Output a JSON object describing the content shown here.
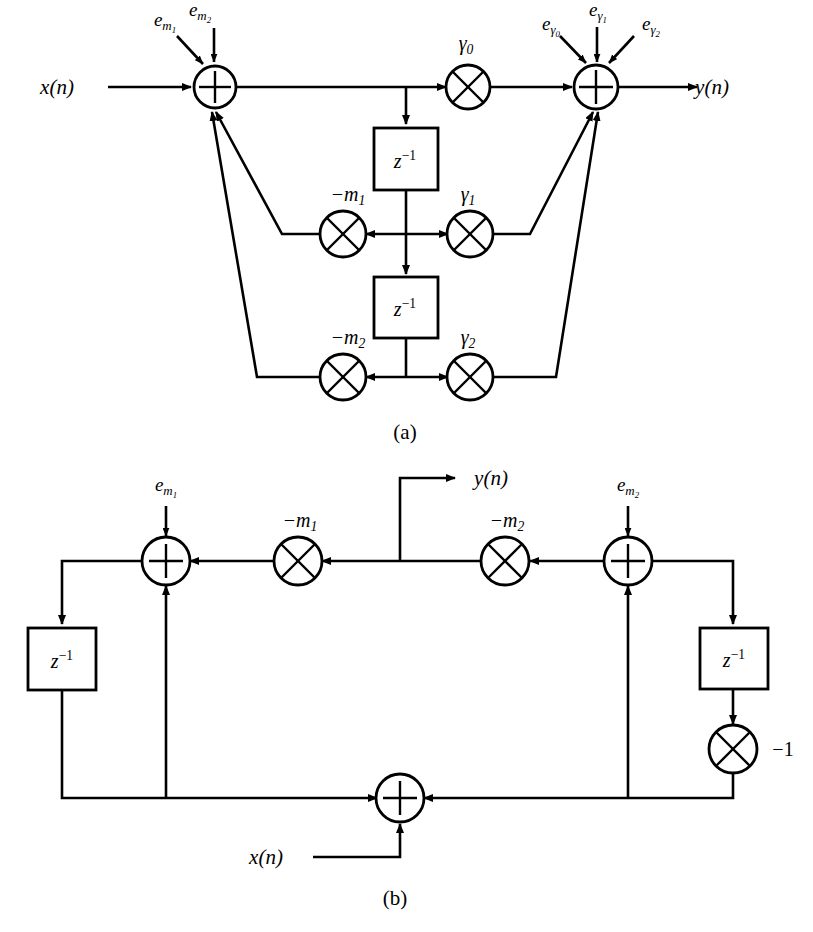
{
  "figure": {
    "background_color": "#ffffff",
    "line_color": "#000000",
    "panels": [
      {
        "id": "a",
        "caption": "(a)"
      },
      {
        "id": "b",
        "caption": "(b)"
      }
    ]
  },
  "panel_a": {
    "caption": "(a)",
    "input_label": "x(n)",
    "output_label": "y(n)",
    "adders": [
      {
        "name": "input-adder",
        "symbol": "+"
      },
      {
        "name": "output-adder",
        "symbol": "+"
      }
    ],
    "error_inputs_left": [
      {
        "base": "e",
        "subscript": "m",
        "subsubscript": "1",
        "text": "e_m1"
      },
      {
        "base": "e",
        "subscript": "m",
        "subsubscript": "2",
        "text": "e_m2"
      }
    ],
    "error_inputs_right": [
      {
        "base": "e",
        "subscript": "γ",
        "subsubscript": "0",
        "text": "e_gamma0"
      },
      {
        "base": "e",
        "subscript": "γ",
        "subsubscript": "1",
        "text": "e_gamma1"
      },
      {
        "base": "e",
        "subscript": "γ",
        "subsubscript": "2",
        "text": "e_gamma2"
      }
    ],
    "multipliers": [
      {
        "name": "gamma0",
        "base": "γ",
        "sub": "0"
      },
      {
        "name": "gamma1",
        "base": "γ",
        "sub": "1"
      },
      {
        "name": "gamma2",
        "base": "γ",
        "sub": "2"
      },
      {
        "name": "minus-m1",
        "base": "−m",
        "sub": "1"
      },
      {
        "name": "minus-m2",
        "base": "−m",
        "sub": "2"
      }
    ],
    "delay_blocks": [
      {
        "name": "delay-1",
        "base": "z",
        "exponent": "−1"
      },
      {
        "name": "delay-2",
        "base": "z",
        "exponent": "−1"
      }
    ]
  },
  "panel_b": {
    "caption": "(b)",
    "input_label": "x(n)",
    "output_label": "y(n)",
    "adders": [
      {
        "name": "left-adder",
        "symbol": "+"
      },
      {
        "name": "right-adder",
        "symbol": "+"
      },
      {
        "name": "bottom-adder",
        "symbol": "+"
      }
    ],
    "error_inputs": [
      {
        "base": "e",
        "subscript": "m",
        "subsubscript": "1",
        "text": "e_m1"
      },
      {
        "base": "e",
        "subscript": "m",
        "subsubscript": "2",
        "text": "e_m2"
      }
    ],
    "multipliers": [
      {
        "name": "minus-m1",
        "base": "−m",
        "sub": "1"
      },
      {
        "name": "minus-m2",
        "base": "−m",
        "sub": "2"
      },
      {
        "name": "minus-one",
        "base": "−1",
        "sub": ""
      }
    ],
    "delay_blocks": [
      {
        "name": "delay-left",
        "base": "z",
        "exponent": "−1"
      },
      {
        "name": "delay-right",
        "base": "z",
        "exponent": "−1"
      }
    ]
  },
  "glyphs": {
    "plus": "+",
    "times": "×",
    "gamma": "γ",
    "minus": "−"
  }
}
